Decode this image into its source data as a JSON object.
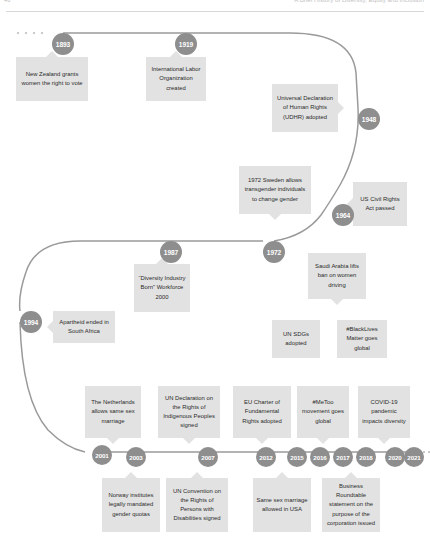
{
  "header": {
    "left_text": "46",
    "right_text": "A Brief History of Diversity, Equity and Inclusion"
  },
  "timeline": {
    "line_color": "#9a9a9a",
    "node_color": "#8e8e8e",
    "node_text_color": "#ffffff",
    "card_color": "#e2e2e2",
    "card_text_color": "#2b2b2b",
    "leading_dots": "· · · ·",
    "trailing_dots": "· · · ·"
  },
  "rows": [
    {
      "name": "row-1",
      "nodes": [
        {
          "year": "1893",
          "x": 52,
          "y": 33,
          "size": "lg"
        },
        {
          "year": "1919",
          "x": 175,
          "y": 33,
          "size": "lg"
        },
        {
          "year": "1948",
          "x": 358,
          "y": 108,
          "size": "lg"
        },
        {
          "year": "1964",
          "x": 332,
          "y": 204,
          "size": "lg"
        }
      ],
      "cards": [
        {
          "text": "New Zealand grants women the right to vote",
          "x": 16,
          "y": 57,
          "w": 72,
          "h": 44,
          "tail": "tail-up"
        },
        {
          "text": "International Labor Organization created",
          "x": 146,
          "y": 57,
          "w": 60,
          "h": 44,
          "tail": "tail-up"
        },
        {
          "text": "Universal Declaration of Human Rights (UDHR) adopted",
          "x": 272,
          "y": 84,
          "w": 66,
          "h": 48,
          "tail": "tail-right"
        },
        {
          "text": "US Civil Rights Act passed",
          "x": 353,
          "y": 182,
          "w": 54,
          "h": 44,
          "tail": "tail-left"
        }
      ]
    },
    {
      "name": "row-2",
      "nodes": [
        {
          "year": "1972",
          "x": 263,
          "y": 241,
          "size": "lg"
        },
        {
          "year": "1987",
          "x": 160,
          "y": 241,
          "size": "lg"
        },
        {
          "year": "1994",
          "x": 20,
          "y": 311,
          "size": "lg"
        }
      ],
      "cards": [
        {
          "text": "1972 Sweden allows transgender individuals to change gender",
          "x": 239,
          "y": 166,
          "w": 72,
          "h": 48,
          "tail": "tail-down"
        },
        {
          "text": "“Diversity Industry Born” Workforce 2000",
          "x": 134,
          "y": 264,
          "w": 56,
          "h": 48,
          "tail": "tail-up"
        },
        {
          "text": "Apartheid ended in South Africa",
          "x": 53,
          "y": 311,
          "w": 62,
          "h": 32,
          "tail": "tail-left"
        },
        {
          "text": "Saudi Arabia lifts ban on women driving",
          "x": 308,
          "y": 253,
          "w": 58,
          "h": 46,
          "tail": "tail-down"
        },
        {
          "text": "UN SDGs adopted",
          "x": 272,
          "y": 320,
          "w": 48,
          "h": 38,
          "tail": "none"
        },
        {
          "text": "#BlackLives Matter goes global",
          "x": 337,
          "y": 320,
          "w": 50,
          "h": 38,
          "tail": "none"
        }
      ]
    },
    {
      "name": "row-3",
      "nodes": [
        {
          "year": "2001",
          "x": 92,
          "y": 445,
          "size": "md"
        },
        {
          "year": "2003",
          "x": 126,
          "y": 447,
          "size": "md"
        },
        {
          "year": "2007",
          "x": 198,
          "y": 447,
          "size": "md"
        },
        {
          "year": "2012",
          "x": 256,
          "y": 447,
          "size": "md"
        },
        {
          "year": "2015",
          "x": 287,
          "y": 447,
          "size": "md"
        },
        {
          "year": "2016",
          "x": 310,
          "y": 447,
          "size": "md"
        },
        {
          "year": "2017",
          "x": 333,
          "y": 447,
          "size": "md"
        },
        {
          "year": "2018",
          "x": 356,
          "y": 447,
          "size": "md"
        },
        {
          "year": "2020",
          "x": 385,
          "y": 447,
          "size": "md"
        },
        {
          "year": "2021",
          "x": 404,
          "y": 447,
          "size": "md"
        }
      ],
      "cards": [
        {
          "text": "The Netherlands allows same sex marriage",
          "x": 85,
          "y": 386,
          "w": 56,
          "h": 52,
          "tail": "tail-down"
        },
        {
          "text": "UN Declaration on the Rights of Indigenous Peoples signed",
          "x": 158,
          "y": 386,
          "w": 62,
          "h": 52,
          "tail": "tail-down"
        },
        {
          "text": "EU Charter of Fundamental Rights adopted",
          "x": 233,
          "y": 386,
          "w": 58,
          "h": 52,
          "tail": "tail-down"
        },
        {
          "text": "#MeToo movement goes global",
          "x": 297,
          "y": 386,
          "w": 52,
          "h": 52,
          "tail": "tail-down"
        },
        {
          "text": "COVID-19 pandemic impacts diversity",
          "x": 358,
          "y": 386,
          "w": 52,
          "h": 52,
          "tail": "tail-down"
        },
        {
          "text": "Norway institutes legally mandated gender quotas",
          "x": 102,
          "y": 478,
          "w": 58,
          "h": 54,
          "tail": "tail-up"
        },
        {
          "text": "UN Convention on the Rights of Persons with Disabilities signed",
          "x": 166,
          "y": 478,
          "w": 62,
          "h": 54,
          "tail": "tail-up"
        },
        {
          "text": "Same sex marriage allowed in USA",
          "x": 253,
          "y": 478,
          "w": 58,
          "h": 54,
          "tail": "tail-up"
        },
        {
          "text": "Business Roundtable statement on the purpose of the corporation issued",
          "x": 322,
          "y": 478,
          "w": 58,
          "h": 54,
          "tail": "tail-up"
        }
      ]
    }
  ]
}
